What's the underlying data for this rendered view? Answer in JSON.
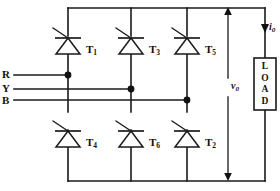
{
  "diagram": {
    "type": "circuit-schematic",
    "background_color": "#ffffff",
    "line_color": "#1a1a1a"
  },
  "phases": [
    {
      "id": "R",
      "label": "R",
      "connects_leg": 1
    },
    {
      "id": "Y",
      "label": "Y",
      "connects_leg": 2
    },
    {
      "id": "B",
      "label": "B",
      "connects_leg": 3
    }
  ],
  "thyristors": {
    "upper": [
      {
        "id": "T1",
        "label": "T",
        "sub": "1",
        "leg": 1
      },
      {
        "id": "T3",
        "label": "T",
        "sub": "3",
        "leg": 2
      },
      {
        "id": "T5",
        "label": "T",
        "sub": "5",
        "leg": 3
      }
    ],
    "lower": [
      {
        "id": "T4",
        "label": "T",
        "sub": "4",
        "leg": 1
      },
      {
        "id": "T6",
        "label": "T",
        "sub": "6",
        "leg": 2
      },
      {
        "id": "T2",
        "label": "T",
        "sub": "2",
        "leg": 3
      }
    ]
  },
  "load": {
    "label": "LOAD",
    "letters": [
      "L",
      "O",
      "A",
      "D"
    ]
  },
  "measurements": {
    "voltage": {
      "symbol": "v",
      "sub": "0",
      "label": "v0",
      "arrow": "double-vertical"
    },
    "current": {
      "symbol": "i",
      "sub": "0",
      "label": "i0",
      "arrow": "down"
    }
  }
}
